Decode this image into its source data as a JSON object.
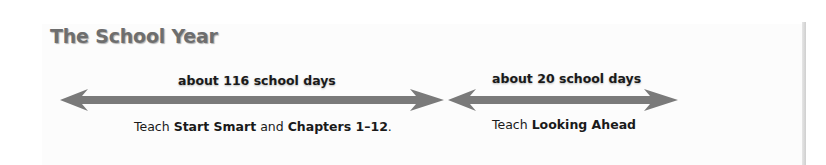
{
  "title": "The School Year",
  "colors": {
    "arrow": "#7a7a7a",
    "title": "#6e6e6e",
    "text": "#1a1a1a"
  },
  "segments": [
    {
      "duration_label": "about 116 school days",
      "description": {
        "prefix": "Teach ",
        "bold1": "Start Smart",
        "middle": " and ",
        "bold2": "Chapters 1–12",
        "suffix": "."
      }
    },
    {
      "duration_label": "about 20 school days",
      "description": {
        "prefix": "Teach ",
        "bold1": "Looking Ahead"
      }
    }
  ]
}
